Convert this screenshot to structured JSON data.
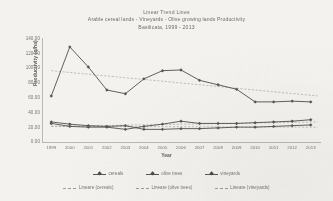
{
  "chart_data": {
    "type": "line",
    "title": "Linear Trend Lines",
    "subtitle": "Arable cereal lands - Vineyards - Olive growing lands Productivity",
    "subtitle2": "Basilicata, 1999 - 2013",
    "xlabel": "Year",
    "ylabel": "Productivity (q/ha)",
    "ylim": [
      0,
      140
    ],
    "yticks": [
      "140.00",
      "120.00",
      "100.00",
      "80.00",
      "60.00",
      "40.00",
      "20.00",
      "0.00"
    ],
    "ytick_values": [
      140,
      120,
      100,
      80,
      60,
      40,
      20,
      0
    ],
    "grid": false,
    "legend_position": "bottom",
    "categories": [
      "1999",
      "2000",
      "2001",
      "2002",
      "2003",
      "2004",
      "2005",
      "2006",
      "2007",
      "2008",
      "2009",
      "2010",
      "2011",
      "2012",
      "2013"
    ],
    "series": [
      {
        "name": "cereals",
        "values": [
          62,
          128,
          101,
          70,
          65,
          85,
          96,
          97,
          83,
          77,
          71,
          54,
          54,
          55,
          54
        ]
      },
      {
        "name": "olive trees",
        "values": [
          27,
          24,
          22,
          21,
          22,
          17,
          17,
          18,
          18,
          19,
          20,
          20,
          21,
          22,
          23
        ]
      },
      {
        "name": "vineyards",
        "values": [
          25,
          21,
          20,
          20,
          17,
          21,
          24,
          28,
          25,
          25,
          25,
          26,
          27,
          28,
          30
        ]
      }
    ],
    "trendlines": [
      {
        "name": "Lineare (cereals)",
        "from": 96,
        "to": 62
      },
      {
        "name": "Lineare (olive trees)",
        "from": 21,
        "to": 20
      },
      {
        "name": "Lineare (vineyards)",
        "from": 21,
        "to": 27
      }
    ],
    "legend_series": [
      "cereals",
      "olive trees",
      "vineyards"
    ],
    "legend_trend": [
      "Lineare (cereals)",
      "Lineare (olive trees)",
      "Lineare (vineyards)"
    ],
    "colors": {
      "series": "#585754",
      "trend": "#9b9a96",
      "axis": "#b9b8b4",
      "text": "#76756f",
      "background": "#f3f2ef"
    }
  }
}
